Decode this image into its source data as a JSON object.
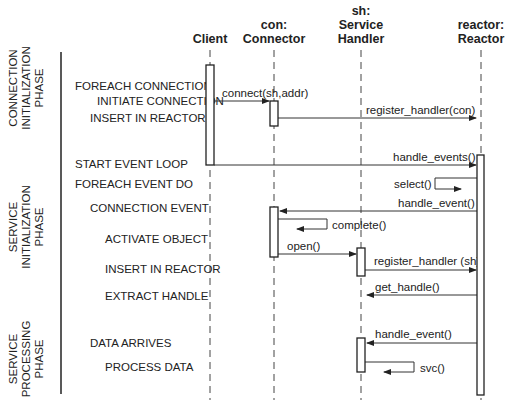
{
  "diagram": {
    "type": "sequence",
    "participants": [
      {
        "id": "client",
        "lines": [
          "Client"
        ]
      },
      {
        "id": "connector",
        "lines": [
          "con:",
          "Connector"
        ]
      },
      {
        "id": "service_handler",
        "lines": [
          "sh:",
          "Service",
          "Handler"
        ]
      },
      {
        "id": "reactor",
        "lines": [
          "reactor:",
          "Reactor"
        ]
      }
    ],
    "phases": [
      {
        "id": "connection_init",
        "lines": [
          "CONNECTION",
          "INITIALIZATION",
          "PHASE"
        ]
      },
      {
        "id": "service_init",
        "lines": [
          "SERVICE",
          "INITIALIZATION",
          "PHASE"
        ]
      },
      {
        "id": "service_processing",
        "lines": [
          "SERVICE",
          "PROCESSING",
          "PHASE"
        ]
      }
    ],
    "steps": [
      "FOREACH CONNECTION",
      "INITIATE CONNECTION",
      "INSERT IN REACTOR",
      "START EVENT LOOP",
      "FOREACH EVENT DO",
      "CONNECTION EVENT",
      "ACTIVATE OBJECT",
      "INSERT IN REACTOR",
      "EXTRACT HANDLE",
      "DATA ARRIVES",
      "PROCESS DATA"
    ],
    "messages": [
      {
        "from": "client",
        "to": "connector",
        "label": "connect(sh,addr)"
      },
      {
        "from": "connector",
        "to": "reactor",
        "label": "register_handler(con)"
      },
      {
        "from": "client",
        "to": "reactor",
        "label": "handle_events()"
      },
      {
        "from": "reactor",
        "to": "reactor",
        "label": "select()"
      },
      {
        "from": "reactor",
        "to": "connector",
        "label": "handle_event()"
      },
      {
        "from": "connector",
        "to": "connector",
        "label": "complete()"
      },
      {
        "from": "connector",
        "to": "service_handler",
        "label": "open()"
      },
      {
        "from": "service_handler",
        "to": "reactor",
        "label": "register_handler (sh)"
      },
      {
        "from": "reactor",
        "to": "service_handler",
        "label": "get_handle()"
      },
      {
        "from": "reactor",
        "to": "service_handler",
        "label": "handle_event()"
      },
      {
        "from": "service_handler",
        "to": "service_handler",
        "label": "svc()"
      }
    ]
  }
}
